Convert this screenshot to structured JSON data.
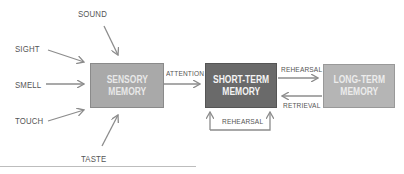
{
  "inputs": {
    "sound": "SOUND",
    "sight": "SIGHT",
    "smell": "SMELL",
    "touch": "TOUCH",
    "taste": "TASTE"
  },
  "boxes": {
    "sensory": {
      "line1": "SENSORY",
      "line2": "MEMORY",
      "fill": "#a9a9a9"
    },
    "short_term": {
      "line1": "SHORT-TERM",
      "line2": "MEMORY",
      "fill": "#6a6a6a"
    },
    "long_term": {
      "line1": "LONG-TERM",
      "line2": "MEMORY",
      "fill": "#b5b5b5"
    }
  },
  "arrows": {
    "attention": "ATTENTION",
    "rehearsal_forward": "REHEARSAL",
    "retrieval": "RETRIEVAL",
    "rehearsal_loop": "REHEARSAL"
  },
  "colors": {
    "arrow": "#8c8c8c",
    "text": "#555555"
  }
}
